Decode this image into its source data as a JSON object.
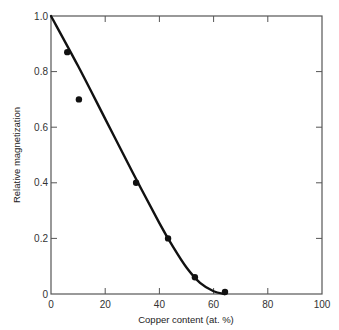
{
  "chart_data": {
    "type": "scatter",
    "title": "",
    "xlabel": "Copper content (at. %)",
    "ylabel": "Relative magnetization",
    "xlim": [
      0,
      100
    ],
    "ylim": [
      0,
      1.0
    ],
    "xticks": [
      0,
      20,
      40,
      60,
      80,
      100
    ],
    "yticks": [
      0,
      0.2,
      0.4,
      0.6,
      0.8,
      1.0
    ],
    "xtick_labels": [
      "0",
      "20",
      "40",
      "60",
      "80",
      "100"
    ],
    "ytick_labels": [
      "0",
      "0.2",
      "0.4",
      "0.6",
      "0.8",
      "1.0"
    ],
    "grid": false,
    "legend": null,
    "series": [
      {
        "name": "measured",
        "kind": "scatter",
        "x": [
          6,
          10.3,
          31.4,
          43.2,
          53.1,
          64.2
        ],
        "y": [
          0.87,
          0.7,
          0.4,
          0.2,
          0.06,
          0.007
        ]
      },
      {
        "name": "fitted curve",
        "kind": "line",
        "x": [
          0,
          10,
          20,
          30,
          40,
          45,
          50,
          55,
          60,
          64
        ],
        "y": [
          1.0,
          0.82,
          0.63,
          0.44,
          0.255,
          0.17,
          0.095,
          0.04,
          0.01,
          0.0
        ]
      }
    ],
    "colors": {
      "line": "#111111",
      "marker": "#111111",
      "axis": "#555555"
    }
  }
}
